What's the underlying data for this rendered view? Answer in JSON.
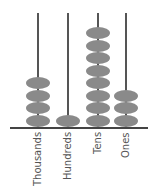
{
  "abacus": {
    "bead_color": "#8a8a8a",
    "rod_color": "#555555",
    "columns": [
      {
        "label": "Thousands",
        "beads": 4
      },
      {
        "label": "Hundreds",
        "beads": 1
      },
      {
        "label": "Tens",
        "beads": 8
      },
      {
        "label": "Ones",
        "beads": 3
      }
    ]
  }
}
